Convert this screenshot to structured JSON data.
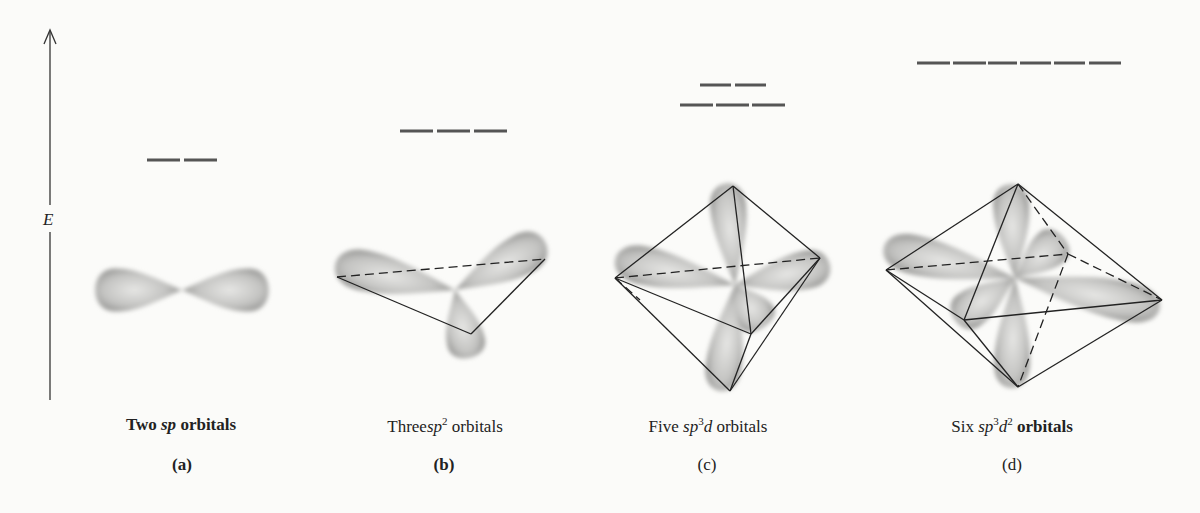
{
  "figure": {
    "axis": {
      "label": "E",
      "direction": "up"
    },
    "panels": [
      {
        "id": "a",
        "caption_prefix": "Two",
        "caption_orbital": "sp",
        "caption_sup": "",
        "caption_d": "",
        "caption_dsup": "",
        "caption_suffix": "orbitals",
        "sub_label": "(a)",
        "energy_levels": [
          {
            "count": 2
          }
        ],
        "geometry": "linear"
      },
      {
        "id": "b",
        "caption_prefix": "Three",
        "caption_orbital": "sp",
        "caption_sup": "2",
        "caption_d": "",
        "caption_dsup": "",
        "caption_suffix": "orbitals",
        "sub_label": "(b)",
        "energy_levels": [
          {
            "count": 3
          }
        ],
        "geometry": "trigonal planar"
      },
      {
        "id": "c",
        "caption_prefix": "Five",
        "caption_orbital": "sp",
        "caption_sup": "3",
        "caption_d": "d",
        "caption_dsup": "",
        "caption_suffix": "orbitals",
        "sub_label": "(c)",
        "energy_levels": [
          {
            "count": 2
          },
          {
            "count": 3
          }
        ],
        "geometry": "trigonal bipyramidal"
      },
      {
        "id": "d",
        "caption_prefix": "Six",
        "caption_orbital": "sp",
        "caption_sup": "3",
        "caption_d": "d",
        "caption_dsup": "2",
        "caption_suffix": "orbitals",
        "sub_label": "(d)",
        "energy_levels": [
          {
            "count": 6
          }
        ],
        "geometry": "octahedral"
      }
    ],
    "colors": {
      "background": "#fbfbf9",
      "lines": "#222222",
      "lobe": "#8a8a8a",
      "levels": "#555555"
    }
  }
}
